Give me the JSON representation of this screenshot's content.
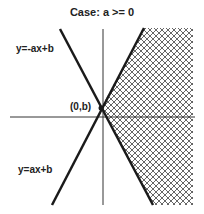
{
  "title": "Case: a >= 0",
  "labels": {
    "upper_line": "y=-ax+b",
    "lower_line": "y=ax+b",
    "intercept": "(0,b)"
  },
  "colors": {
    "line": "#1a1a1a",
    "axis": "#333333",
    "hatch": "#555555",
    "background": "#ffffff"
  },
  "shaded_region": "right of both lines (x-hatched)"
}
